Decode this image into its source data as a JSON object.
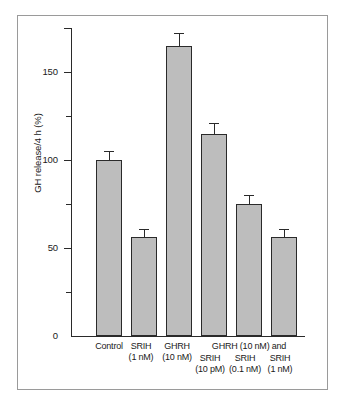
{
  "chart_data": {
    "type": "bar",
    "title": "",
    "subtitle": "",
    "xlabel": "",
    "ylabel": "GH release/4 h (%)",
    "ylim": [
      0,
      175
    ],
    "grid": false,
    "legend": "none",
    "y_major_ticks": [
      {
        "value": 0,
        "label": "0"
      },
      {
        "value": 50,
        "label": "50"
      },
      {
        "value": 100,
        "label": "100"
      },
      {
        "value": 150,
        "label": "150"
      }
    ],
    "y_minor_ticks": [
      25,
      75,
      125,
      175
    ],
    "categories": [
      "Control",
      "SRIH (1 nM)",
      "GHRH (10 nM)",
      "GHRH (10 nM) and SRIH (10 pM)",
      "GHRH (10 nM) and SRIH (0.1 nM)",
      "GHRH (10 nM) and SRIH (1 nM)"
    ],
    "values": [
      100,
      56,
      165,
      115,
      75,
      56
    ],
    "errors": [
      5,
      5,
      7,
      6,
      5,
      5
    ],
    "bar_color": "#bdbdbd",
    "bar_edge_color": "#2a2a2a",
    "axis_color": "#2a2a2a",
    "frame_color": "#9a9a9a",
    "group_header": "GHRH (10 nM) and",
    "tick_labels_x": [
      {
        "line1": "Control",
        "line2": ""
      },
      {
        "line1": "SRIH",
        "line2": "(1 nM)"
      },
      {
        "line1": "GHRH",
        "line2": "(10 nM)"
      },
      {
        "line1": "SRIH",
        "line2": "(10 pM)"
      },
      {
        "line1": "SRIH",
        "line2": "(0.1 nM)"
      },
      {
        "line1": "SRIH",
        "line2": "(1 nM)"
      }
    ]
  }
}
